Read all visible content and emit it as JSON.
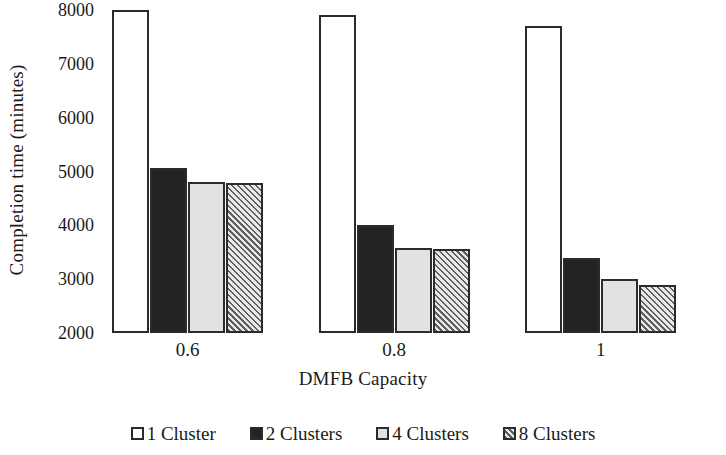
{
  "chart_data": {
    "type": "bar",
    "title": "",
    "xlabel": "DMFB Capacity",
    "ylabel": "Completion time (minutes)",
    "categories": [
      "0.6",
      "0.8",
      "1"
    ],
    "ylim": [
      2000,
      8000
    ],
    "yticks": [
      2000,
      3000,
      4000,
      5000,
      6000,
      7000,
      8000
    ],
    "ytick_labels": [
      "2000",
      "3000",
      "4000",
      "5000",
      "6000",
      "7000",
      "8000"
    ],
    "grid": false,
    "legend_position": "bottom",
    "series": [
      {
        "name": "1 Cluster",
        "fill": "white",
        "color": "#ffffff",
        "values": [
          8000,
          7900,
          7700
        ]
      },
      {
        "name": "2 Clusters",
        "fill": "black",
        "color": "#232323",
        "values": [
          5060,
          4000,
          3400
        ]
      },
      {
        "name": "4 Clusters",
        "fill": "lightgray",
        "color": "#e2e2e2",
        "values": [
          4800,
          3580,
          3000
        ]
      },
      {
        "name": "8 Clusters",
        "fill": "hatch",
        "color": "#d9d9d9",
        "values": [
          4780,
          3560,
          2900
        ]
      }
    ]
  },
  "legend": {
    "items": [
      {
        "label": "1 Cluster",
        "fill": "white"
      },
      {
        "label": "2 Clusters",
        "fill": "black"
      },
      {
        "label": "4 Clusters",
        "fill": "lightgray"
      },
      {
        "label": "8 Clusters",
        "fill": "hatch"
      }
    ]
  }
}
